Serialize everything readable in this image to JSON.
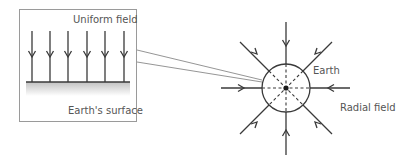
{
  "inset": {
    "title": "Uniform field",
    "surface_label": "Earth's surface"
  },
  "main": {
    "earth_label": "Earth",
    "field_label": "Radial field"
  },
  "colors": {
    "line": "#3a3a3a",
    "box_border": "#9a9a9a",
    "surface_shade": "#c8c8c8"
  }
}
